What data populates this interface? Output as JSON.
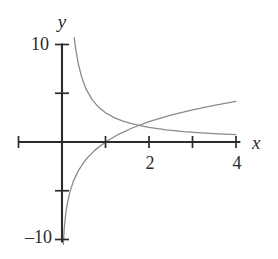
{
  "figure": {
    "background_color": "#ffffff",
    "axis_color": "#2b2b2b",
    "curve_color": "#8a8a8a",
    "label_color": "#2b2b2b"
  },
  "labels": {
    "y_axis": "y",
    "x_axis": "x",
    "y_top": "10",
    "y_bottom": "–10",
    "x_two": "2",
    "x_four": "4"
  },
  "chart_data": {
    "type": "line",
    "title": "",
    "xlabel": "x",
    "ylabel": "y",
    "xlim": [
      -1.0,
      5.0
    ],
    "ylim": [
      -10.5,
      10.2
    ],
    "grid": false,
    "legend": "none",
    "xticks": [
      1,
      2,
      3,
      4
    ],
    "xtick_labels": [
      "",
      "2",
      "",
      "4"
    ],
    "yticks": [
      -10,
      -5,
      5,
      10
    ],
    "ytick_labels": [
      "–10",
      "",
      "",
      "10"
    ],
    "axes": {
      "x_axis_drawn_from": -1.0,
      "x_axis_drawn_to": 4.1,
      "y_axis_drawn_from": -10.3,
      "y_axis_drawn_to": 10.1
    },
    "series": [
      {
        "name": "decaying-hyperbola",
        "expression": "y = 3/x",
        "color": "#8a8a8a",
        "x": [
          0.28,
          0.32,
          0.38,
          0.45,
          0.55,
          0.7,
          0.85,
          1.0,
          1.2,
          1.4,
          1.6,
          1.8,
          2.0,
          2.4,
          2.8,
          3.2,
          3.6,
          4.0
        ],
        "y": [
          10.7,
          9.4,
          7.9,
          6.7,
          5.45,
          4.29,
          3.53,
          3.0,
          2.5,
          2.14,
          1.88,
          1.67,
          1.5,
          1.25,
          1.07,
          0.94,
          0.83,
          0.75
        ]
      },
      {
        "name": "logarithm",
        "expression": "y = 3·ln(x)",
        "color": "#8a8a8a",
        "x": [
          0.03,
          0.05,
          0.08,
          0.12,
          0.18,
          0.26,
          0.38,
          0.55,
          0.75,
          1.0,
          1.3,
          1.6,
          2.0,
          2.5,
          3.0,
          3.5,
          4.0
        ],
        "y": [
          -10.5,
          -8.99,
          -7.58,
          -6.36,
          -5.14,
          -4.04,
          -2.9,
          -1.79,
          -0.86,
          0.0,
          0.79,
          1.41,
          2.08,
          2.75,
          3.3,
          3.76,
          4.16
        ]
      }
    ],
    "annotations": [
      {
        "name": "curve-intersection",
        "x": 1.73,
        "y": 1.73
      }
    ]
  }
}
